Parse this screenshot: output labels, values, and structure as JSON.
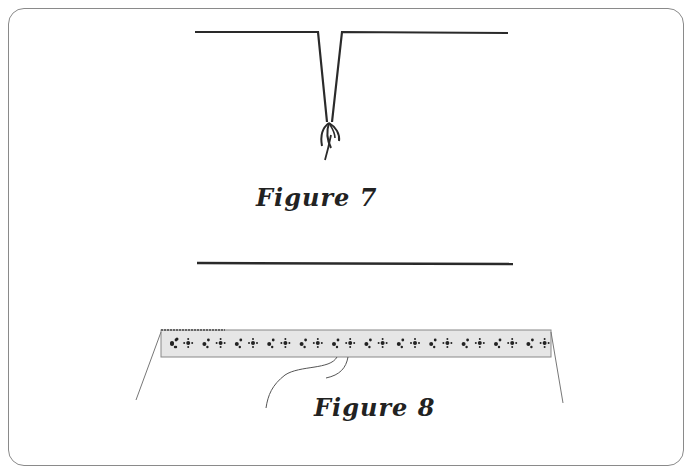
{
  "figures": [
    {
      "caption": "Figure 7",
      "description": "Two horizontal lines meeting in a V-shaped dart with thread tails tied at the point"
    },
    {
      "caption": "Figure 8",
      "description": "Horizontal line above a decorative patterned band (lace/trim strip) with diverging guide lines"
    }
  ],
  "colors": {
    "line": "#2a2a2a",
    "frame": "#8a8a8a",
    "band_fill": "#e6e6e6"
  }
}
